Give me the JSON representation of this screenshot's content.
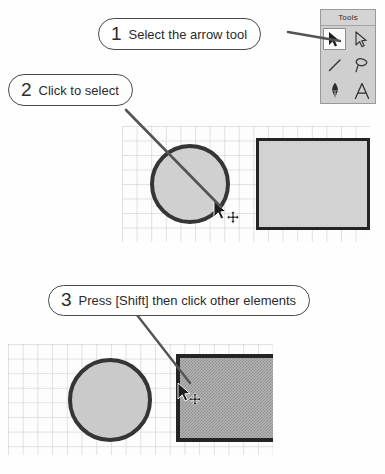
{
  "tools_palette": {
    "title": "Tools",
    "items": [
      {
        "name": "arrow-select-tool",
        "icon": "filled-arrow-icon",
        "selected": true
      },
      {
        "name": "direct-select-tool",
        "icon": "outline-arrow-icon",
        "selected": false
      },
      {
        "name": "line-tool",
        "icon": "line-icon",
        "selected": false
      },
      {
        "name": "lasso-tool",
        "icon": "lasso-icon",
        "selected": false
      },
      {
        "name": "pen-tool",
        "icon": "pen-nib-icon",
        "selected": false
      },
      {
        "name": "text-tool",
        "icon": "letter-a-icon",
        "label": "A",
        "selected": false
      }
    ]
  },
  "callouts": [
    {
      "number": "1",
      "text": "Select the arrow tool"
    },
    {
      "number": "2",
      "text": "Click to select"
    },
    {
      "number": "3",
      "text": "Press [Shift] then click other elements"
    }
  ],
  "canvases": [
    {
      "name": "canvas-step-2",
      "shapes": [
        {
          "name": "circle-shape",
          "type": "circle",
          "selected": true,
          "fill": "#d0d0d0",
          "stroke": "#353535"
        },
        {
          "name": "rectangle-shape",
          "type": "rect",
          "selected": false,
          "fill": "#d2d2d2",
          "stroke": "#242424"
        }
      ],
      "cursor": {
        "name": "arrow-move-cursor",
        "icon": "arrow-with-move-icon"
      }
    },
    {
      "name": "canvas-step-3",
      "shapes": [
        {
          "name": "circle-shape",
          "type": "circle",
          "selected": true,
          "fill": "#cacaca",
          "stroke": "#353535"
        },
        {
          "name": "rectangle-shape",
          "type": "rect",
          "selected": true,
          "fill": "#b3b3b3",
          "stroke": "#242424"
        }
      ],
      "cursor": {
        "name": "arrow-move-cursor",
        "icon": "arrow-with-move-icon"
      }
    }
  ],
  "colors": {
    "page_background": "#fefefe",
    "callout_border": "#4a4a4a",
    "leader_line": "#545454",
    "grid_line": "#c4c4c4",
    "palette_background": "#cfcfcf",
    "shape_fill": "#d0d0d0",
    "shape_stroke": "#242424",
    "selected_fill": "#b3b3b3"
  }
}
